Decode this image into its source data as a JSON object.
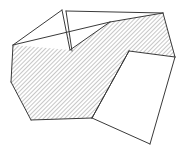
{
  "figure": {
    "title": "Hatched polygonal line-drawing",
    "type": "line-drawing",
    "canvas": {
      "width": 184,
      "height": 152,
      "background": "#ffffff"
    },
    "style": {
      "stroke_color": "#3a3a3a",
      "stroke_width": 1,
      "hatch_color": "#6b6b6b",
      "hatch_angle_deg": 45,
      "hatch_spacing_px": 3,
      "fill_color": "#ffffff"
    },
    "shapes": [
      {
        "name": "main-hatched-band",
        "hatched": true,
        "points": "13,45 11,82 31,120 92,118 129,51 175,57 163,13 110,22"
      },
      {
        "name": "upper-left-white-flap",
        "hatched": false,
        "points": "13,45 62,10 70,50"
      },
      {
        "name": "upper-right-white-flap",
        "hatched": false,
        "points": "66,11 163,13 110,22 70,50"
      },
      {
        "name": "lower-right-white-wedge",
        "hatched": false,
        "points": "129,51 175,57 150,144 92,118"
      }
    ],
    "segments": [
      {
        "name": "edge-left-upper",
        "from": "13,45",
        "to": "11,82"
      },
      {
        "name": "edge-left-lower",
        "from": "11,82",
        "to": "31,120"
      },
      {
        "name": "edge-bottom-band",
        "from": "31,120",
        "to": "92,118"
      },
      {
        "name": "edge-band-to-notch",
        "from": "92,118",
        "to": "129,51"
      },
      {
        "name": "edge-notch-to-right",
        "from": "129,51",
        "to": "175,57"
      },
      {
        "name": "edge-right-up",
        "from": "175,57",
        "to": "163,13"
      },
      {
        "name": "edge-top-right",
        "from": "163,13",
        "to": "110,22"
      },
      {
        "name": "edge-top-left",
        "from": "110,22",
        "to": "13,45"
      },
      {
        "name": "crease-left-flap-a",
        "from": "13,45",
        "to": "62,10"
      },
      {
        "name": "crease-left-flap-b",
        "from": "62,10",
        "to": "70,50"
      },
      {
        "name": "crease-sliver",
        "from": "66,11",
        "to": "72,51"
      },
      {
        "name": "crease-top-fold",
        "from": "66,11",
        "to": "163,13"
      },
      {
        "name": "crease-mid-fold",
        "from": "70,50",
        "to": "110,22"
      },
      {
        "name": "wedge-edge-left",
        "from": "129,51",
        "to": "92,118"
      },
      {
        "name": "wedge-edge-right",
        "from": "175,57",
        "to": "150,144"
      },
      {
        "name": "wedge-edge-bottom",
        "from": "92,118",
        "to": "150,144"
      }
    ],
    "vertices": [
      {
        "name": "v-left-upper",
        "x": 13,
        "y": 45
      },
      {
        "name": "v-left-lower",
        "x": 11,
        "y": 82
      },
      {
        "name": "v-bottom-left",
        "x": 31,
        "y": 120
      },
      {
        "name": "v-bottom-mid",
        "x": 92,
        "y": 118
      },
      {
        "name": "v-notch",
        "x": 129,
        "y": 51
      },
      {
        "name": "v-right-mid",
        "x": 175,
        "y": 57
      },
      {
        "name": "v-right-top",
        "x": 163,
        "y": 13
      },
      {
        "name": "v-top-mid",
        "x": 110,
        "y": 22
      },
      {
        "name": "v-apex",
        "x": 62,
        "y": 10
      },
      {
        "name": "v-fold",
        "x": 70,
        "y": 50
      },
      {
        "name": "v-bottom-tip",
        "x": 150,
        "y": 144
      }
    ]
  }
}
